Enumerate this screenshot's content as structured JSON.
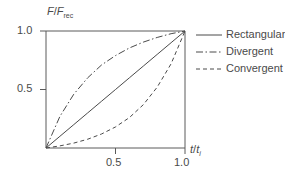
{
  "chart_data": {
    "type": "line",
    "title": "",
    "xlabel": "t/t_i",
    "ylabel": "F/F_rec",
    "xlim": [
      0,
      1.0
    ],
    "ylim": [
      0,
      1.0
    ],
    "grid": false,
    "legend_position": "right",
    "x_tick_labels": [
      "0.5",
      "1.0"
    ],
    "x_tick_values": [
      0.5,
      1.0
    ],
    "y_tick_labels": [
      "0.5",
      "1.0"
    ],
    "y_tick_values": [
      0.5,
      1.0
    ],
    "x": [
      0,
      0.1,
      0.2,
      0.3,
      0.4,
      0.5,
      0.6,
      0.7,
      0.8,
      0.9,
      1.0
    ],
    "series": [
      {
        "name": "Rectangular",
        "style": "solid",
        "values": [
          0,
          0.1,
          0.2,
          0.3,
          0.4,
          0.5,
          0.6,
          0.7,
          0.8,
          0.9,
          1.0
        ]
      },
      {
        "name": "Divergent",
        "style": "dash-dot",
        "values": [
          0,
          0.27,
          0.46,
          0.6,
          0.71,
          0.79,
          0.855,
          0.905,
          0.945,
          0.977,
          1.0
        ]
      },
      {
        "name": "Convergent",
        "style": "dashed",
        "values": [
          0,
          0.018,
          0.042,
          0.075,
          0.12,
          0.18,
          0.26,
          0.37,
          0.52,
          0.72,
          1.0
        ]
      }
    ]
  },
  "axis_labels": {
    "y_symbol": "F",
    "y_denominator": "F",
    "y_subscript": "rec",
    "x_symbol": "t",
    "x_denominator": "t",
    "x_subscript": "i",
    "slash": "/"
  },
  "ticks": {
    "y_top": "1.0",
    "y_mid": "0.5",
    "x_mid": "0.5",
    "x_max": "1.0"
  },
  "legend": {
    "items": [
      {
        "label": "Rectangular",
        "style": "solid"
      },
      {
        "label": "Divergent",
        "style": "dash-dot"
      },
      {
        "label": "Convergent",
        "style": "dashed"
      }
    ]
  }
}
